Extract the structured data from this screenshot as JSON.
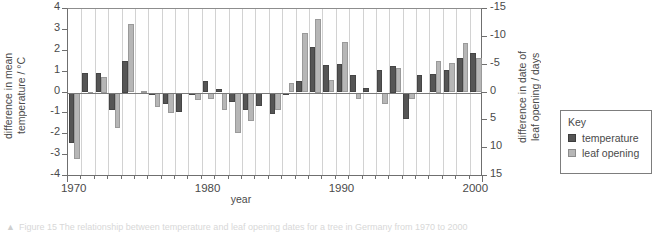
{
  "axes": {
    "left_title": "difference in mean\ntemperature / °C",
    "right_title": "difference in date of\nleaf opening / days",
    "x_title": "year",
    "left_ticks": [
      "4",
      "3",
      "2",
      "1",
      "0",
      "-1",
      "-2",
      "-3",
      "-4"
    ],
    "right_ticks": [
      "-15",
      "-10",
      "-5",
      "0",
      "5",
      "10",
      "15"
    ],
    "x_ticks": [
      "1970",
      "1980",
      "1990",
      "2000"
    ]
  },
  "key": {
    "title": "Key",
    "items": [
      {
        "label": "temperature",
        "color": "#555555",
        "swatch": "temp-swatch"
      },
      {
        "label": "leaf opening",
        "color": "#b6b6b6",
        "swatch": "leaf-swatch"
      }
    ]
  },
  "caption": {
    "marker": "▲",
    "text": "Figure 15 The relationship between temperature and leaf opening dates for a tree in Germany from 1970 to 2000"
  },
  "chart_data": {
    "type": "bar",
    "title": "",
    "xlabel": "year",
    "ylabel": "difference in mean temperature / °C",
    "y2label": "difference in date of leaf opening / days",
    "ylim": [
      -4,
      4
    ],
    "y2lim": [
      15,
      -15
    ],
    "y2_inverted": true,
    "grid": true,
    "legend_position": "right-outside",
    "categories": [
      1970,
      1971,
      1972,
      1973,
      1974,
      1975,
      1976,
      1977,
      1978,
      1979,
      1980,
      1981,
      1982,
      1983,
      1984,
      1985,
      1986,
      1987,
      1988,
      1989,
      1990,
      1991,
      1992,
      1993,
      1994,
      1995,
      1996,
      1997,
      1998,
      1999,
      2000
    ],
    "series": [
      {
        "name": "temperature",
        "unit": "°C",
        "color": "#555555",
        "axis": "left",
        "values": [
          -2.4,
          0.95,
          0.95,
          -0.85,
          1.5,
          0.0,
          -0.1,
          -0.55,
          -0.95,
          -0.1,
          0.55,
          0.15,
          -0.45,
          -0.85,
          -0.65,
          -1.05,
          -0.05,
          0.55,
          2.2,
          1.3,
          1.35,
          0.85,
          0.2,
          1.1,
          1.25,
          -1.25,
          0.85,
          0.9,
          1.1,
          1.65,
          1.9
        ]
      },
      {
        "name": "leaf opening",
        "unit": "days",
        "color": "#b6b6b6",
        "axis": "right",
        "values_deg": [
          -3.2,
          0.02,
          0.75,
          -1.7,
          3.3,
          0.05,
          -0.7,
          -1.0,
          0.0,
          -0.35,
          -0.3,
          -0.85,
          -1.95,
          -1.35,
          0.0,
          -0.85,
          0.45,
          2.85,
          3.5,
          0.6,
          2.4,
          -0.3,
          0.0,
          -0.55,
          1.15,
          -0.3,
          0.0,
          1.5,
          1.4,
          2.35,
          1.65
        ],
        "values_days": [
          12.0,
          -0.1,
          -2.8,
          6.4,
          -12.4,
          -0.2,
          2.6,
          3.8,
          0.0,
          1.3,
          1.1,
          3.2,
          7.3,
          5.1,
          0.0,
          3.2,
          -1.7,
          -10.7,
          -13.1,
          -2.3,
          -9.0,
          1.1,
          0.0,
          2.1,
          -4.3,
          1.1,
          0.0,
          -5.6,
          -5.3,
          -8.8,
          -6.2
        ]
      }
    ]
  }
}
